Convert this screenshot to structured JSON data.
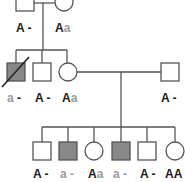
{
  "diagram": {
    "type": "pedigree",
    "colors": {
      "line": "#555555",
      "affected_fill": "#888888",
      "unaffected_fill": "#ffffff",
      "dominant_text": "#1a1a1a",
      "recessive_text": "#9a9a9a"
    },
    "generations": [
      {
        "id": "I",
        "individuals": [
          {
            "id": "I-1",
            "sex": "male",
            "affected": false,
            "deceased": false,
            "genotype": {
              "a1": "A",
              "a2": "-"
            }
          },
          {
            "id": "I-2",
            "sex": "female",
            "affected": false,
            "deceased": false,
            "genotype": {
              "a1": "A",
              "a2": "a"
            }
          }
        ]
      },
      {
        "id": "II",
        "individuals": [
          {
            "id": "II-1",
            "sex": "male",
            "affected": true,
            "deceased": true,
            "genotype": {
              "a1": "a",
              "a2": "-"
            }
          },
          {
            "id": "II-2",
            "sex": "male",
            "affected": false,
            "deceased": false,
            "genotype": {
              "a1": "A",
              "a2": "-"
            }
          },
          {
            "id": "II-3",
            "sex": "female",
            "affected": false,
            "deceased": false,
            "genotype": {
              "a1": "A",
              "a2": "a"
            }
          },
          {
            "id": "II-4",
            "sex": "male",
            "affected": false,
            "deceased": false,
            "genotype": {
              "a1": "A",
              "a2": "-"
            }
          }
        ]
      },
      {
        "id": "III",
        "individuals": [
          {
            "id": "III-1",
            "sex": "male",
            "affected": false,
            "deceased": false,
            "genotype": {
              "a1": "A",
              "a2": "-"
            }
          },
          {
            "id": "III-2",
            "sex": "male",
            "affected": true,
            "deceased": false,
            "genotype": {
              "a1": "a",
              "a2": "-"
            }
          },
          {
            "id": "III-3",
            "sex": "female",
            "affected": false,
            "deceased": false,
            "genotype": {
              "a1": "A",
              "a2": "a"
            }
          },
          {
            "id": "III-4",
            "sex": "male",
            "affected": true,
            "deceased": false,
            "genotype": {
              "a1": "a",
              "a2": "-"
            }
          },
          {
            "id": "III-5",
            "sex": "male",
            "affected": false,
            "deceased": false,
            "genotype": {
              "a1": "A",
              "a2": "-"
            }
          },
          {
            "id": "III-6",
            "sex": "female",
            "affected": false,
            "deceased": false,
            "genotype": {
              "a1": "A",
              "a2": "A"
            }
          }
        ]
      }
    ]
  }
}
